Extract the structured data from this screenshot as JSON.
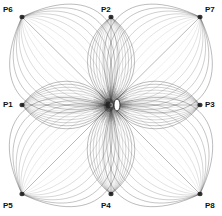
{
  "figure": {
    "background_color": "#ffffff",
    "line_color": "#4a4a4a",
    "node_color": "#1a1a1a",
    "width": 222,
    "height": 216
  },
  "chart_data": {
    "type": "scatter",
    "title": "",
    "xlabel": "",
    "ylabel": "",
    "xlim": [
      0,
      222
    ],
    "ylim": [
      0,
      216
    ],
    "grid": false,
    "legend": "none",
    "center": {
      "x": 111,
      "y": 105,
      "label": "hub"
    },
    "categories": [
      "P1",
      "P2",
      "P3",
      "P4",
      "P5",
      "P6",
      "P7",
      "P8"
    ],
    "values": [
      1,
      1,
      1,
      1,
      1,
      1,
      1,
      1
    ],
    "nodes": [
      {
        "name": "P1",
        "x": 22,
        "y": 105,
        "position": "left-center",
        "label_x": 3,
        "label_y": 100,
        "lobe": "lens"
      },
      {
        "name": "P2",
        "x": 111,
        "y": 17,
        "position": "top-center",
        "label_x": 101,
        "label_y": 5,
        "lobe": "lens"
      },
      {
        "name": "P3",
        "x": 200,
        "y": 105,
        "position": "right-center",
        "label_x": 205,
        "label_y": 100,
        "lobe": "lens"
      },
      {
        "name": "P4",
        "x": 111,
        "y": 194,
        "position": "bottom-center",
        "label_x": 101,
        "label_y": 201,
        "lobe": "lens"
      },
      {
        "name": "P5",
        "x": 22,
        "y": 194,
        "position": "bottom-left",
        "label_x": 3,
        "label_y": 201,
        "lobe": "petal"
      },
      {
        "name": "P6",
        "x": 22,
        "y": 17,
        "position": "top-left",
        "label_x": 3,
        "label_y": 5,
        "lobe": "petal"
      },
      {
        "name": "P7",
        "x": 200,
        "y": 17,
        "position": "top-right",
        "label_x": 205,
        "label_y": 5,
        "lobe": "petal"
      },
      {
        "name": "P8",
        "x": 200,
        "y": 194,
        "position": "bottom-right",
        "label_x": 205,
        "label_y": 201,
        "lobe": "petal"
      }
    ],
    "streamlines_per_lobe": 17,
    "core_void": {
      "cx": 117,
      "cy": 105,
      "rx": 3,
      "ry": 6,
      "shape": "ellipse",
      "color": "#ffffff"
    }
  },
  "labels": {
    "p1": "P1",
    "p2": "P2",
    "p3": "P3",
    "p4": "P4",
    "p5": "P5",
    "p6": "P6",
    "p7": "P7",
    "p8": "P8"
  }
}
